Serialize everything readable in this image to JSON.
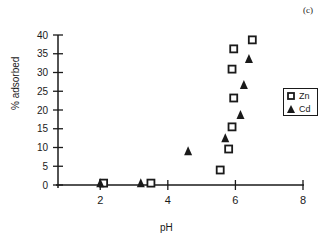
{
  "chart_data": {
    "type": "scatter",
    "panel_label": "(c)",
    "title": "",
    "xlabel": "pH",
    "ylabel": "% adsorbed",
    "xlim": [
      0.75,
      8
    ],
    "ylim": [
      0,
      40
    ],
    "xticks": [
      2,
      4,
      6,
      8
    ],
    "yticks": [
      0,
      5,
      10,
      15,
      20,
      25,
      30,
      35,
      40
    ],
    "grid": false,
    "legend_position": "right",
    "series": [
      {
        "name": "Zn",
        "marker": "open-square",
        "points": [
          {
            "x": 2.1,
            "y": 0.5
          },
          {
            "x": 3.5,
            "y": 0.5
          },
          {
            "x": 5.55,
            "y": 4
          },
          {
            "x": 5.8,
            "y": 9.6
          },
          {
            "x": 5.9,
            "y": 15.5
          },
          {
            "x": 5.95,
            "y": 23.2
          },
          {
            "x": 5.9,
            "y": 30.9
          },
          {
            "x": 5.95,
            "y": 36.3
          },
          {
            "x": 6.5,
            "y": 38.7
          }
        ]
      },
      {
        "name": "Cd",
        "marker": "filled-triangle",
        "points": [
          {
            "x": 2.0,
            "y": 0.5
          },
          {
            "x": 3.2,
            "y": 0.5
          },
          {
            "x": 4.6,
            "y": 9
          },
          {
            "x": 5.7,
            "y": 12.5
          },
          {
            "x": 6.15,
            "y": 18.7
          },
          {
            "x": 6.25,
            "y": 26.7
          },
          {
            "x": 6.4,
            "y": 33.6
          }
        ]
      }
    ]
  },
  "legend": {
    "items": [
      {
        "label": "Zn",
        "symbol": "open-square-icon"
      },
      {
        "label": "Cd",
        "symbol": "filled-triangle-icon"
      }
    ]
  }
}
